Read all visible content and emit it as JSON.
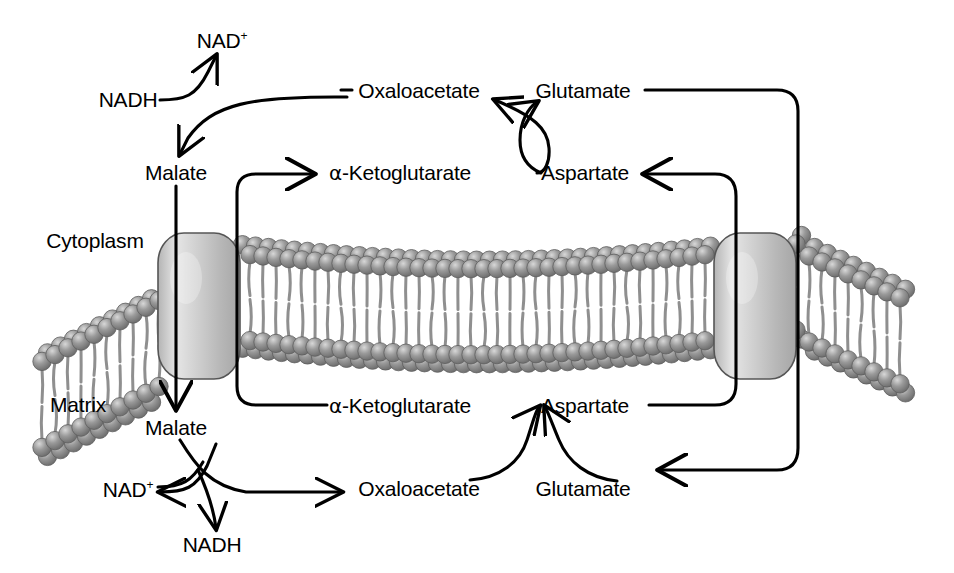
{
  "diagram": {
    "compartments": {
      "upper_label": "Cytoplasm",
      "lower_label": "Matrix"
    },
    "colors": {
      "line": "#000000",
      "text": "#000000",
      "lipid_head": "#8a8a8a",
      "lipid_head_dark": "#5e5e5e",
      "lipid_tail": "#8f8f8f",
      "transporter_fill": "#c9c9c9",
      "transporter_highlight": "#e8e8e8",
      "transporter_stroke": "#4a4a4a",
      "background": "#ffffff"
    },
    "metabolites": {
      "cyto_nad_plus": "NAD",
      "cyto_nad_plus_sup": "+",
      "cyto_nadh": "NADH",
      "cyto_malate": "Malate",
      "cyto_oxaloacetate": "Oxaloacetate",
      "cyto_glutamate": "Glutamate",
      "cyto_akg": "-Ketoglutarate",
      "cyto_akg_greek": "α",
      "cyto_aspartate": "Aspartate",
      "matrix_malate": "Malate",
      "matrix_nad_plus": "NAD",
      "matrix_nad_plus_sup": "+",
      "matrix_nadh": "NADH",
      "matrix_akg": "-Ketoglutarate",
      "matrix_akg_greek": "α",
      "matrix_aspartate": "Aspartate",
      "matrix_oxaloacetate": "Oxaloacetate",
      "matrix_glutamate": "Glutamate"
    },
    "label_positions": {
      "cyto_nad_plus": [
        222,
        40
      ],
      "cyto_nadh": [
        128,
        99
      ],
      "cyto_malate": [
        176,
        172
      ],
      "cyto_oxaloacetate": [
        419,
        90
      ],
      "cyto_glutamate": [
        583,
        90
      ],
      "cyto_akg": [
        400,
        172
      ],
      "cyto_aspartate": [
        585,
        172
      ],
      "cytoplasm": [
        95,
        240
      ],
      "matrix": [
        78,
        404
      ],
      "matrix_malate": [
        176,
        427
      ],
      "matrix_nad_plus": [
        128,
        489
      ],
      "matrix_nadh": [
        212,
        544
      ],
      "matrix_akg": [
        400,
        405
      ],
      "matrix_aspartate": [
        585,
        405
      ],
      "matrix_oxaloacetate": [
        419,
        488
      ],
      "matrix_glutamate": [
        583,
        488
      ]
    },
    "transporters": [
      {
        "name": "malate-alpha-ketoglutarate-carrier",
        "x": 158,
        "y": 233,
        "w": 82,
        "h": 145
      },
      {
        "name": "glutamate-aspartate-carrier",
        "x": 714,
        "y": 233,
        "w": 82,
        "h": 145
      }
    ],
    "reaction_arrows": [
      {
        "name": "cyto-malate-dehydrogenase",
        "from": "NADH",
        "to": "NAD+"
      },
      {
        "name": "matrix-malate-dehydrogenase",
        "from": "NAD+",
        "to": "NADH"
      },
      {
        "name": "cyto-aspartate-aminotransferase-akg-to-glutamate",
        "from": "α-Ketoglutarate",
        "to": "Glutamate"
      },
      {
        "name": "cyto-aspartate-aminotransferase-asp-to-oaa",
        "from": "Aspartate",
        "to": "Oxaloacetate"
      },
      {
        "name": "matrix-aspartate-aminotransferase-oaa-to-asp",
        "from": "Oxaloacetate",
        "to": "Aspartate"
      },
      {
        "name": "matrix-aspartate-aminotransferase-glu-to-akg",
        "from": "Glutamate",
        "to": "α-Ketoglutarate"
      }
    ]
  }
}
